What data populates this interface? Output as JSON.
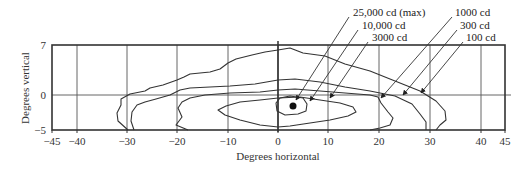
{
  "chart_data": {
    "type": "contour",
    "title": "",
    "xlabel": "Degrees horizontal",
    "ylabel": "Degrees vertical",
    "xlim": [
      -45,
      45
    ],
    "ylim": [
      -5,
      7
    ],
    "x_ticks": [
      -45,
      -40,
      -30,
      -20,
      -10,
      0,
      10,
      20,
      30,
      40,
      45
    ],
    "x_tick_labels": [
      "−45",
      "−40",
      "−30",
      "−20",
      "−10",
      "0",
      "10",
      "20",
      "30",
      "40",
      "45"
    ],
    "y_ticks": [
      7,
      0,
      -5
    ],
    "y_tick_labels": [
      "7",
      "0",
      "−5"
    ],
    "grid": true,
    "max_point": {
      "x": 3,
      "y": -1.5,
      "label": "25,000 cd (max)"
    },
    "series": [
      {
        "name": "100 cd",
        "level": 100,
        "extent_x": [
          -32,
          33
        ],
        "extent_y": [
          -5,
          6.5
        ]
      },
      {
        "name": "300 cd",
        "level": 300,
        "extent_x": [
          -29,
          30
        ],
        "extent_y": [
          -5,
          2.5
        ]
      },
      {
        "name": "1000 cd",
        "level": 1000,
        "extent_x": [
          -20,
          24
        ],
        "extent_y": [
          -5,
          0.5
        ]
      },
      {
        "name": "3000 cd",
        "level": 3000,
        "extent_x": [
          -12,
          15
        ],
        "extent_y": [
          -4.5,
          -0.5
        ]
      },
      {
        "name": "10,000 cd",
        "level": 10000,
        "extent_x": [
          -1,
          6
        ],
        "extent_y": [
          -3,
          0
        ]
      },
      {
        "name": "25,000 cd (max)",
        "level": 25000,
        "extent_x": [
          3,
          3
        ],
        "extent_y": [
          -1.5,
          -1.5
        ]
      }
    ],
    "legend_labels": [
      "25,000 cd (max)",
      "10,000 cd",
      "3000 cd",
      "1000 cd",
      "300 cd",
      "100 cd"
    ]
  },
  "plot": {
    "frame": {
      "x": 52,
      "y": 45,
      "w": 453,
      "h": 85
    },
    "x_positions": [
      52,
      77,
      127,
      177,
      228,
      278,
      328,
      379,
      430,
      481,
      505
    ],
    "y_positions": [
      45,
      95,
      130
    ],
    "zero_x": 278,
    "zero_y": 95,
    "contour_paths": {
      "c100": "M 128,130 L 118,121 L 117,113 L 121,105 L 121,99 L 130,94 L 145,91 L 150,88 L 163,85 L 177,80 L 184,77 L 190,74 L 210,72 L 220,69 L 228,63 L 236,59 L 252,55 L 265,52 L 278,50 L 290,48 L 303,53 L 325,56 L 345,64 L 370,71 L 395,81 L 420,91 L 436,101 L 445,111 L 446,120 L 440,125 L 436,130",
      "c300": "M 134,130 L 131,121 L 132,112 L 137,105 L 145,102 L 156,99 L 170,95 L 180,90 L 190,88 L 210,87 L 230,86 L 255,84 L 278,80 L 295,79 L 320,82 L 345,87 L 370,91 L 395,96 L 412,104 L 420,114 L 426,122 L 426,130",
      "c1000": "M 188,130 L 176,125 L 182,117 L 178,108 L 182,102 L 190,98 L 205,95 L 230,93 L 260,92 L 278,90 L 295,89 L 320,91 L 345,93 L 370,95 L 378,97 L 381,103 L 388,112 L 393,118 L 390,125 L 380,128 L 370,130",
      "c3000": "M 278,127 L 260,125 L 240,120 L 225,115 L 218,110 L 226,106 L 240,102 L 260,100 L 278,98 L 300,97 L 320,100 L 340,103 L 353,107 L 356,112 L 348,116 L 330,120 L 310,123 L 290,126 Z",
      "c10000": "M 276,103 L 280,98 L 290,96 L 303,98 L 307,104 L 306,111 L 298,114 L 285,115 L 277,111 Z"
    },
    "max_dot": {
      "cx": 293,
      "cy": 106,
      "r": 3.5
    },
    "legend_items": [
      {
        "text": "25,000 cd (max)",
        "tx": 353,
        "ty": 16,
        "x1": 349,
        "y1": 17,
        "x2": 296,
        "y2": 100
      },
      {
        "text": "10,000 cd",
        "tx": 362,
        "ty": 29,
        "x1": 358,
        "y1": 30,
        "x2": 310,
        "y2": 101
      },
      {
        "text": "3000 cd",
        "tx": 372,
        "ty": 41,
        "x1": 368,
        "y1": 42,
        "x2": 330,
        "y2": 98
      },
      {
        "text": "1000 cd",
        "tx": 455,
        "ty": 16,
        "x1": 452,
        "y1": 17,
        "x2": 381,
        "y2": 98
      },
      {
        "text": "300 cd",
        "tx": 460,
        "ty": 29,
        "x1": 457,
        "y1": 30,
        "x2": 403,
        "y2": 95
      },
      {
        "text": "100 cd",
        "tx": 466,
        "ty": 41,
        "x1": 463,
        "y1": 42,
        "x2": 421,
        "y2": 93
      }
    ],
    "colors": {
      "ink": "#333333",
      "background": "#ffffff"
    }
  }
}
